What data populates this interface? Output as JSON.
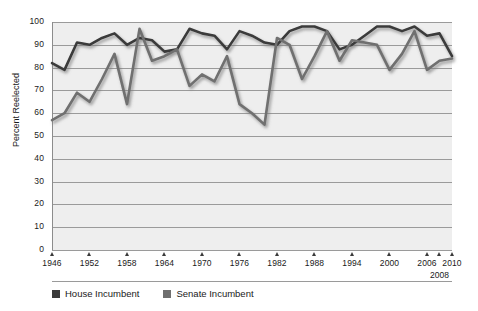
{
  "chart_data": {
    "type": "line",
    "title": "",
    "xlabel": "",
    "ylabel": "Percent Reelected",
    "ylim": [
      0,
      100
    ],
    "ytick_values": [
      0,
      10,
      20,
      30,
      40,
      50,
      60,
      70,
      80,
      90,
      100
    ],
    "ytick_labels": [
      "0",
      "10",
      "20",
      "30",
      "40",
      "50",
      "60",
      "70",
      "80",
      "90",
      "100"
    ],
    "xlim": [
      1946,
      2010
    ],
    "xtick_values": [
      1946,
      1952,
      1958,
      1964,
      1970,
      1976,
      1982,
      1988,
      1994,
      2000,
      2006,
      2008,
      2010
    ],
    "xtick_labels": [
      "1946",
      "1952",
      "1958",
      "1964",
      "1970",
      "1976",
      "1982",
      "1988",
      "1994",
      "2000",
      "2006",
      "2008",
      "2010"
    ],
    "xtick_offset_labels": [
      "2008"
    ],
    "grid": "horizontal",
    "legend_position": "bottom-left",
    "x": [
      1946,
      1948,
      1950,
      1952,
      1954,
      1956,
      1958,
      1960,
      1962,
      1964,
      1966,
      1968,
      1970,
      1972,
      1974,
      1976,
      1978,
      1980,
      1982,
      1984,
      1986,
      1988,
      1990,
      1992,
      1994,
      1996,
      1998,
      2000,
      2002,
      2004,
      2006,
      2008,
      2010
    ],
    "series": [
      {
        "name": "House Incumbent",
        "color": "#3a3a3a",
        "values": [
          82,
          79,
          91,
          90,
          93,
          95,
          90,
          93,
          92,
          87,
          88,
          97,
          95,
          94,
          88,
          96,
          94,
          91,
          90,
          96,
          98,
          98,
          96,
          88,
          90,
          94,
          98,
          98,
          96,
          98,
          94,
          95,
          85
        ]
      },
      {
        "name": "Senate Incumbent",
        "color": "#6f6f6f",
        "values": [
          57,
          60,
          69,
          65,
          75,
          86,
          64,
          97,
          83,
          85,
          88,
          72,
          77,
          74,
          85,
          64,
          60,
          55,
          93,
          90,
          75,
          85,
          96,
          83,
          92,
          91,
          90,
          79,
          86,
          96,
          79,
          83,
          84
        ]
      }
    ]
  },
  "legend": {
    "items": [
      {
        "label": "House Incumbent",
        "color": "#3a3a3a"
      },
      {
        "label": "Senate Incumbent",
        "color": "#6f6f6f"
      }
    ]
  }
}
